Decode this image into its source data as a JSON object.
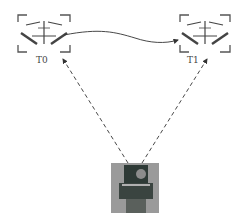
{
  "diagram": {
    "nodes": [
      {
        "id": "T0",
        "label": "T0",
        "kind": "drone-target",
        "bbox": [
          18,
          13,
          52,
          40
        ]
      },
      {
        "id": "T1",
        "label": "T1",
        "kind": "drone-target",
        "bbox": [
          178,
          13,
          52,
          40
        ]
      },
      {
        "id": "camera",
        "label": "",
        "kind": "ground-camera",
        "bbox": [
          111,
          163,
          48,
          50
        ]
      }
    ],
    "edges": [
      {
        "from": "T0",
        "to": "T1",
        "style": "solid-curve",
        "arrow": "end"
      },
      {
        "from": "camera",
        "to": "T0",
        "style": "dashed",
        "arrow": "end"
      },
      {
        "from": "camera",
        "to": "T1",
        "style": "dashed",
        "arrow": "end"
      }
    ]
  },
  "colors": {
    "line": "#333333",
    "bracket": "#555555",
    "drone": "#444444",
    "camera_bg": "#9a9a9a",
    "camera_body": "#2e3a36"
  }
}
